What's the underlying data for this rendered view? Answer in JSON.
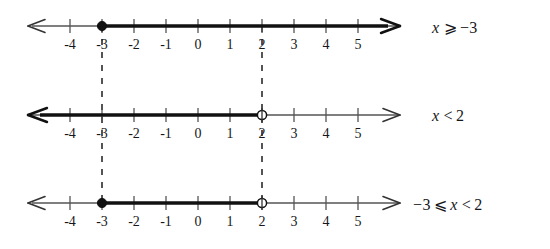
{
  "figure": {
    "type": "number-line-diagram",
    "axis": {
      "tick_labels": [
        "-4",
        "-3",
        "-2",
        "-1",
        "0",
        "1",
        "2",
        "3",
        "4",
        "5"
      ],
      "tick_values": [
        -4,
        -3,
        -2,
        -1,
        0,
        1,
        2,
        3,
        4,
        5
      ],
      "min_visible": -5.3,
      "max_visible": 6.3,
      "left_arrow": true,
      "right_arrow": true,
      "pixels_per_unit": 32,
      "zero_x": 198
    },
    "guides": {
      "dashed_vertical_values": [
        -3,
        2
      ],
      "color": "#2b2b2b"
    },
    "colors": {
      "axis": "#4a4a4a",
      "highlight": "#111111",
      "text": "#17171a",
      "background": "#ffffff"
    },
    "lines": [
      {
        "id": "line-1",
        "y": 26,
        "label": {
          "lhs": "x",
          "relation": "⩾",
          "rhs": "−3",
          "text": "x ⩾ −3"
        },
        "ray": {
          "from": -3,
          "to": "+inf",
          "direction": "right",
          "bold": true,
          "arrow_end": true
        },
        "endpoints": [
          {
            "value": -3,
            "style": "closed"
          }
        ]
      },
      {
        "id": "line-2",
        "y": 115,
        "label": {
          "lhs": "x",
          "relation": "<",
          "rhs": "2",
          "text": "x < 2"
        },
        "ray": {
          "from": "-inf",
          "to": 2,
          "direction": "left",
          "bold": true,
          "arrow_end": true
        },
        "endpoints": [
          {
            "value": 2,
            "style": "open"
          }
        ]
      },
      {
        "id": "line-3",
        "y": 203,
        "label": {
          "lhs": "−3",
          "relation": "⩽",
          "mid": "x",
          "relation2": "<",
          "rhs": "2",
          "text": "−3 ⩽ x < 2"
        },
        "ray": {
          "from": -3,
          "to": 2,
          "direction": "segment",
          "bold": true,
          "arrow_end": false
        },
        "endpoints": [
          {
            "value": -3,
            "style": "closed"
          },
          {
            "value": 2,
            "style": "open"
          }
        ]
      }
    ],
    "labels_x": 432
  }
}
